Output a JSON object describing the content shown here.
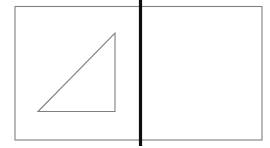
{
  "figure": {
    "canvas": {
      "width": 270,
      "height": 148,
      "background_color": "#ffffff"
    },
    "colors": {
      "outline_gray": "#808080",
      "divider_black": "#0d0d0d",
      "fill_white": "#ffffff"
    },
    "shapes": {
      "outer_rectangle": {
        "label": "outer-rectangle",
        "x": 15,
        "y": 6.5,
        "width": 247,
        "height": 133.5,
        "stroke": "#808080",
        "stroke_width": 1.1,
        "fill": "none"
      },
      "divider_line": {
        "label": "vertical-divider-line",
        "x1": 140.5,
        "y1": 0,
        "x2": 140.5,
        "y2": 146,
        "stroke": "#0d0d0d",
        "stroke_width": 3.2
      },
      "triangle": {
        "label": "right-triangle",
        "points": "38,111.5 115,111.5 115,33",
        "stroke": "#808080",
        "stroke_width": 1.1,
        "fill": "none",
        "vertices": {
          "bottom_left": {
            "x": 38,
            "y": 112
          },
          "bottom_right": {
            "x": 115,
            "y": 112
          },
          "top_right": {
            "x": 115,
            "y": 33
          }
        }
      }
    },
    "regions": {
      "left_half_label": "left-half-region",
      "right_half_label": "right-half-region"
    }
  }
}
